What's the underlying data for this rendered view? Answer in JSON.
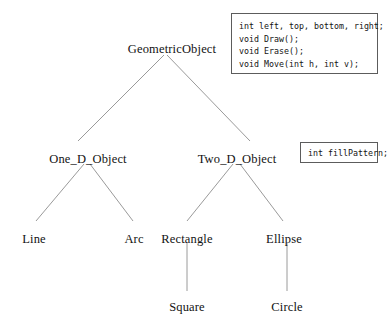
{
  "diagram": {
    "type": "class-inheritance-hierarchy",
    "line_color": "#9a9a9a",
    "text_color": "#121212",
    "box_border_color": "#5c5c5c",
    "background": "#ffffff",
    "nodes": [
      {
        "id": "geometric-object",
        "label": "GeometricObject",
        "x": 172,
        "y": 42,
        "level": 0
      },
      {
        "id": "one-d-object",
        "label": "One_D_Object",
        "x": 88,
        "y": 152,
        "level": 1
      },
      {
        "id": "two-d-object",
        "label": "Two_D_Object",
        "x": 237,
        "y": 152,
        "level": 1
      },
      {
        "id": "line",
        "label": "Line",
        "x": 34,
        "y": 232,
        "level": 2
      },
      {
        "id": "arc",
        "label": "Arc",
        "x": 134,
        "y": 232,
        "level": 2
      },
      {
        "id": "rectangle",
        "label": "Rectangle",
        "x": 187,
        "y": 232,
        "level": 2
      },
      {
        "id": "ellipse",
        "label": "Ellipse",
        "x": 284,
        "y": 232,
        "level": 2
      },
      {
        "id": "square",
        "label": "Square",
        "x": 187,
        "y": 300,
        "level": 3
      },
      {
        "id": "circle",
        "label": "Circle",
        "x": 287,
        "y": 300,
        "level": 3
      }
    ],
    "edges": [
      {
        "from": "geometric-object",
        "to": "one-d-object",
        "x1": 164,
        "y1": 55,
        "x2": 78,
        "y2": 141
      },
      {
        "from": "geometric-object",
        "to": "two-d-object",
        "x1": 167,
        "y1": 55,
        "x2": 250,
        "y2": 141
      },
      {
        "from": "one-d-object",
        "to": "line",
        "x1": 84,
        "y1": 164,
        "x2": 36,
        "y2": 221
      },
      {
        "from": "one-d-object",
        "to": "arc",
        "x1": 90,
        "y1": 164,
        "x2": 133,
        "y2": 221
      },
      {
        "from": "two-d-object",
        "to": "rectangle",
        "x1": 233,
        "y1": 164,
        "x2": 187,
        "y2": 221
      },
      {
        "from": "two-d-object",
        "to": "ellipse",
        "x1": 240,
        "y1": 164,
        "x2": 283,
        "y2": 221
      },
      {
        "from": "rectangle",
        "to": "square",
        "x1": 187,
        "y1": 243,
        "x2": 187,
        "y2": 291
      },
      {
        "from": "ellipse",
        "to": "circle",
        "x1": 287,
        "y1": 243,
        "x2": 287,
        "y2": 291
      }
    ]
  },
  "methods_box": {
    "attached_to": "GeometricObject",
    "lines": [
      "int left, top, bottom, right;",
      "void Draw();",
      "void Erase();",
      "void Move(int h, int v);"
    ]
  },
  "fill_box": {
    "attached_to": "Two_D_Object",
    "lines": [
      "int fillPattern;"
    ]
  }
}
